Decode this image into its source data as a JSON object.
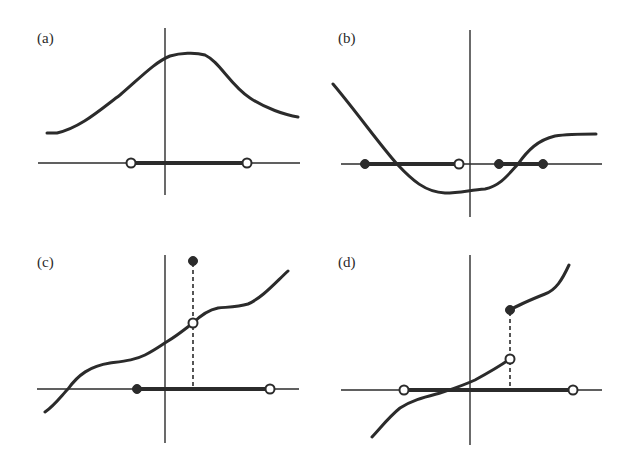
{
  "figure": {
    "colors": {
      "ink": "#2b2b2b",
      "background": "#ffffff"
    },
    "panels": [
      {
        "label": "(a)",
        "curve": "smooth bell-shaped curve, everywhere above the x-axis",
        "interval": {
          "left": "open",
          "right": "open"
        }
      },
      {
        "label": "(b)",
        "curve": "decreasing curve dipping below x-axis then rising to a plateau",
        "intervals": [
          {
            "left": "closed",
            "right": "open"
          },
          {
            "left": "closed",
            "right": "closed"
          }
        ]
      },
      {
        "label": "(c)",
        "curve": "increasing curve with a removable discontinuity: open point on curve, filled point above it",
        "interval": {
          "left": "closed",
          "right": "open"
        },
        "discontinuity": {
          "on_curve": "open",
          "value_point": "closed",
          "dashed_guide": true
        }
      },
      {
        "label": "(d)",
        "curve": "increasing curve with a jump discontinuity: lower branch ends in open point, upper branch starts with filled point",
        "interval": {
          "left": "open",
          "right": "open"
        },
        "discontinuity": {
          "lower_end": "open",
          "upper_start": "closed",
          "dashed_guide": true
        }
      }
    ]
  }
}
